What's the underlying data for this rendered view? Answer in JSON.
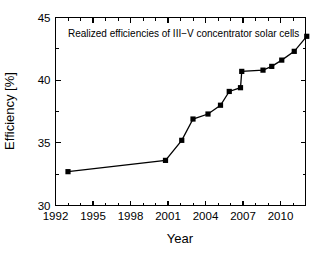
{
  "chart_data": {
    "type": "line",
    "title": "",
    "annotation": "Realized efficiencies of III−V concentrator solar cells",
    "xlabel": "Year",
    "ylabel": "Efficiency [%]",
    "xlim": [
      1992,
      2012
    ],
    "ylim": [
      30,
      45
    ],
    "grid": false,
    "legend": "none",
    "marker": "square",
    "marker_color": "#000000",
    "line_color": "#000000",
    "x_ticks_major": [
      1992,
      1995,
      1998,
      2001,
      2004,
      2007,
      2010
    ],
    "x_tick_labels": [
      "1992",
      "1995",
      "1998",
      "2001",
      "2004",
      "2007",
      "2010"
    ],
    "x_tick_minor_step": 1,
    "y_ticks_major": [
      30,
      35,
      40,
      45
    ],
    "y_tick_labels": [
      "30",
      "35",
      "40",
      "45"
    ],
    "y_tick_minor_step": 2.5,
    "series": [
      {
        "name": "Realized efficiencies of III-V concentrator solar cells",
        "x": [
          1993.0,
          2000.8,
          2002.1,
          2003.0,
          2004.2,
          2005.2,
          2005.9,
          2006.8,
          2006.9,
          2008.6,
          2009.3,
          2010.1,
          2011.1,
          2012.1
        ],
        "y": [
          32.7,
          33.6,
          35.2,
          36.9,
          37.3,
          38.0,
          39.1,
          39.4,
          40.7,
          40.8,
          41.1,
          41.6,
          42.3,
          43.5
        ]
      }
    ]
  },
  "figure": {
    "background": "#ffffff",
    "axes_color": "#000000"
  }
}
